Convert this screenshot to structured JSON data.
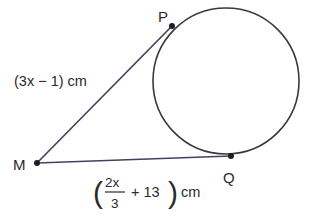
{
  "diagram": {
    "colors": {
      "circle": "#3a3a3a",
      "segment": "#4b3d5e",
      "point": "#1e1e1e",
      "text": "#2a2a2a"
    },
    "circle": {
      "cx": 226,
      "cy": 81,
      "r": 73
    },
    "points": [
      {
        "id": "P",
        "label": "P",
        "x": 172,
        "y": 26
      },
      {
        "id": "M",
        "label": "M",
        "x": 37,
        "y": 163
      },
      {
        "id": "Q",
        "label": "Q",
        "x": 231,
        "y": 156
      }
    ],
    "segments": [
      {
        "from": "M",
        "to": "P",
        "label": "(3x − 1) cm"
      },
      {
        "from": "M",
        "to": "Q",
        "label_parts": {
          "open": "(",
          "numerator": "2x",
          "denominator": "3",
          "rest": "+ 13",
          "close": ")",
          "unit": "cm"
        }
      }
    ]
  }
}
